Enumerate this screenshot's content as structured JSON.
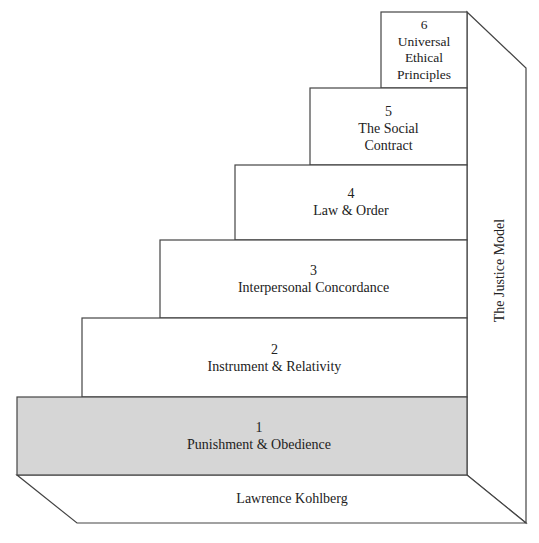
{
  "diagram": {
    "title": "The Justice Model",
    "author": "Lawrence Kohlberg",
    "stages": [
      {
        "number": "1",
        "name": "Punishment & Obedience",
        "highlighted": true
      },
      {
        "number": "2",
        "name": "Instrument & Relativity",
        "highlighted": false
      },
      {
        "number": "3",
        "name": "Interpersonal Concordance",
        "highlighted": false
      },
      {
        "number": "4",
        "name": "Law & Order",
        "highlighted": false
      },
      {
        "number": "5",
        "name": "The Social Contract",
        "highlighted": false
      },
      {
        "number": "6",
        "name": "Universal Ethical Principles",
        "highlighted": false
      }
    ],
    "colors": {
      "highlight": "#d6d6d6",
      "line": "#444444",
      "background": "#ffffff"
    }
  }
}
